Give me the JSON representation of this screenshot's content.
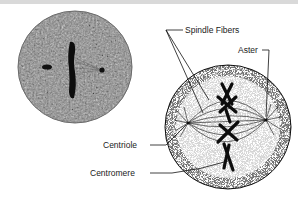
{
  "figure": {
    "labels": {
      "spindle_fibers": "Spindle Fibers",
      "aster": "Aster",
      "centriole": "Centriole",
      "centromere": "Centromere"
    }
  },
  "colors": {
    "photo_fill": "#8a8a8a",
    "ink": "#111111",
    "top_band": "#d9d9d9"
  }
}
